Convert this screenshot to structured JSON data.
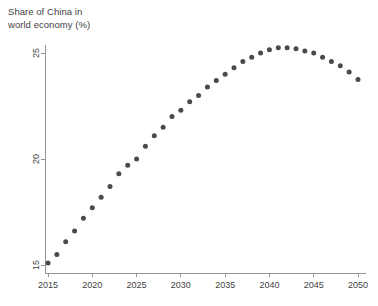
{
  "chart_data": {
    "type": "scatter",
    "title": "Share of China in\nworld economy (%)",
    "xlabel": "",
    "ylabel": "",
    "xlim": [
      2015,
      2050
    ],
    "ylim": [
      14.6,
      25.6
    ],
    "xticks": [
      2015,
      2020,
      2025,
      2030,
      2035,
      2040,
      2045,
      2050
    ],
    "yticks": [
      15,
      20,
      25
    ],
    "grid": false,
    "legend": "none",
    "marker_color": "#4a4a4a",
    "axis_color": "#8a8a8a",
    "x": [
      2015,
      2016,
      2017,
      2018,
      2019,
      2020,
      2021,
      2022,
      2023,
      2024,
      2025,
      2026,
      2027,
      2028,
      2029,
      2030,
      2031,
      2032,
      2033,
      2034,
      2035,
      2036,
      2037,
      2038,
      2039,
      2040,
      2041,
      2042,
      2043,
      2044,
      2045,
      2046,
      2047,
      2048,
      2049,
      2050
    ],
    "values": [
      15.1,
      15.5,
      16.1,
      16.6,
      17.2,
      17.7,
      18.2,
      18.7,
      19.3,
      19.7,
      20.0,
      20.6,
      21.1,
      21.5,
      22.0,
      22.3,
      22.7,
      23.0,
      23.4,
      23.7,
      24.0,
      24.3,
      24.6,
      24.8,
      25.0,
      25.15,
      25.25,
      25.25,
      25.2,
      25.1,
      25.0,
      24.8,
      24.6,
      24.4,
      24.1,
      23.75
    ],
    "series_name": "Share of China in world economy (%)"
  }
}
